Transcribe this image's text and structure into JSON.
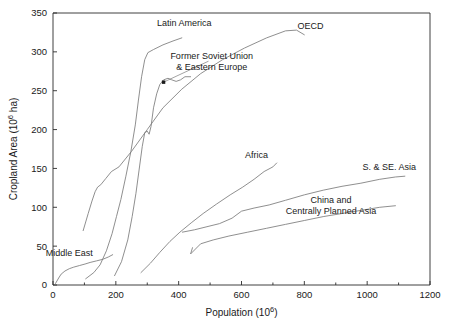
{
  "chart_data": {
    "type": "line",
    "title": "",
    "xlabel": "Population (10⁶)",
    "ylabel": "Cropland Area (10⁶ ha)",
    "xlim": [
      0,
      1200
    ],
    "ylim": [
      0,
      350
    ],
    "xticks": [
      0,
      200,
      400,
      600,
      800,
      1000,
      1200
    ],
    "xtick_labels": [
      "0",
      "200",
      "400",
      "600",
      "800",
      "1000",
      "1200"
    ],
    "xminor_ticks": [
      100,
      300,
      500,
      700,
      900,
      1100
    ],
    "yticks": [
      0,
      50,
      100,
      150,
      200,
      250,
      300,
      350
    ],
    "ytick_labels": [
      "0",
      "50",
      "100",
      "150",
      "200",
      "250",
      "300",
      "350"
    ],
    "grid": false,
    "legend_position": "inline-annotations",
    "series": [
      {
        "name": "Middle East",
        "label": "Middle East",
        "label_x": 52,
        "label_y": 37,
        "points": [
          [
            8,
            2
          ],
          [
            18,
            9
          ],
          [
            26,
            14
          ],
          [
            38,
            18
          ],
          [
            52,
            21
          ],
          [
            66,
            23
          ],
          [
            84,
            25
          ],
          [
            102,
            27
          ],
          [
            118,
            29
          ],
          [
            138,
            31
          ],
          [
            158,
            33
          ],
          [
            176,
            36
          ],
          [
            190,
            39
          ]
        ]
      },
      {
        "name": "OECD",
        "label": "OECD",
        "label_x": 820,
        "label_y": 330,
        "points": [
          [
            96,
            70
          ],
          [
            112,
            92
          ],
          [
            124,
            108
          ],
          [
            134,
            120
          ],
          [
            142,
            126
          ],
          [
            152,
            129
          ],
          [
            168,
            137
          ],
          [
            186,
            146
          ],
          [
            210,
            152
          ],
          [
            250,
            172
          ],
          [
            300,
            200
          ],
          [
            350,
            228
          ],
          [
            410,
            252
          ],
          [
            470,
            272
          ],
          [
            540,
            290
          ],
          [
            610,
            305
          ],
          [
            680,
            318
          ],
          [
            740,
            327
          ],
          [
            775,
            328
          ],
          [
            800,
            322
          ]
        ]
      },
      {
        "name": "Latin America",
        "label": "Latin America",
        "label_x": 418,
        "label_y": 333,
        "points": [
          [
            104,
            8
          ],
          [
            130,
            16
          ],
          [
            150,
            26
          ],
          [
            170,
            44
          ],
          [
            188,
            66
          ],
          [
            202,
            88
          ],
          [
            216,
            110
          ],
          [
            232,
            140
          ],
          [
            248,
            172
          ],
          [
            262,
            206
          ],
          [
            272,
            238
          ],
          [
            282,
            268
          ],
          [
            292,
            290
          ],
          [
            302,
            299
          ],
          [
            320,
            303
          ],
          [
            350,
            309
          ],
          [
            382,
            314
          ],
          [
            410,
            318
          ]
        ]
      },
      {
        "name": "Former Soviet Union & Eastern Europe",
        "label": "Former Soviet Union",
        "label2": "& Eastern Europe",
        "label_x": 505,
        "label_y": 291,
        "label2_x": 505,
        "label2_y": 277,
        "points": [
          [
            196,
            12
          ],
          [
            218,
            30
          ],
          [
            238,
            58
          ],
          [
            252,
            88
          ],
          [
            264,
            118
          ],
          [
            274,
            148
          ],
          [
            284,
            178
          ],
          [
            292,
            196
          ],
          [
            300,
            198
          ],
          [
            306,
            194
          ],
          [
            312,
            204
          ],
          [
            320,
            228
          ],
          [
            330,
            246
          ],
          [
            340,
            258
          ],
          [
            352,
            264
          ],
          [
            366,
            266
          ],
          [
            378,
            264
          ],
          [
            392,
            262
          ],
          [
            406,
            264
          ],
          [
            420,
            268
          ],
          [
            438,
            268
          ]
        ]
      },
      {
        "name": "Africa",
        "label": "Africa",
        "label_x": 648,
        "label_y": 163,
        "points": [
          [
            280,
            16
          ],
          [
            310,
            28
          ],
          [
            340,
            42
          ],
          [
            372,
            56
          ],
          [
            404,
            68
          ],
          [
            440,
            80
          ],
          [
            478,
            92
          ],
          [
            520,
            104
          ],
          [
            564,
            116
          ],
          [
            604,
            126
          ],
          [
            640,
            136
          ],
          [
            672,
            146
          ],
          [
            700,
            152
          ],
          [
            712,
            157
          ]
        ]
      },
      {
        "name": "S. & SE. Asia",
        "label": "S. & SE. Asia",
        "label_x": 1070,
        "label_y": 148,
        "points": [
          [
            412,
            68
          ],
          [
            450,
            71
          ],
          [
            490,
            75
          ],
          [
            530,
            79
          ],
          [
            570,
            86
          ],
          [
            600,
            95
          ],
          [
            640,
            99
          ],
          [
            688,
            103
          ],
          [
            740,
            109
          ],
          [
            800,
            116
          ],
          [
            860,
            122
          ],
          [
            920,
            127
          ],
          [
            980,
            131
          ],
          [
            1040,
            136
          ],
          [
            1090,
            139
          ],
          [
            1120,
            140
          ]
        ]
      },
      {
        "name": "China and Centrally Planned Asia",
        "label": "China and",
        "label2": "Centrally Planned Asia",
        "label_x": 885,
        "label_y": 106,
        "label2_x": 885,
        "label2_y": 92,
        "points": [
          [
            444,
            48
          ],
          [
            438,
            40
          ],
          [
            470,
            53
          ],
          [
            510,
            58
          ],
          [
            560,
            63
          ],
          [
            620,
            68
          ],
          [
            680,
            73
          ],
          [
            740,
            78
          ],
          [
            800,
            83
          ],
          [
            860,
            88
          ],
          [
            920,
            92
          ],
          [
            980,
            96
          ],
          [
            1040,
            100
          ],
          [
            1090,
            102
          ]
        ]
      }
    ],
    "annotation": {
      "name": "fsu-leader-line",
      "marker_x": 352,
      "marker_y": 261,
      "from_x": 352,
      "from_y": 261,
      "to_x": 495,
      "to_y": 288
    }
  },
  "colors": {
    "axis": "#2b2b2b",
    "series_line": "#7b7b7b",
    "text": "#1a1a1a",
    "background": "#ffffff"
  }
}
